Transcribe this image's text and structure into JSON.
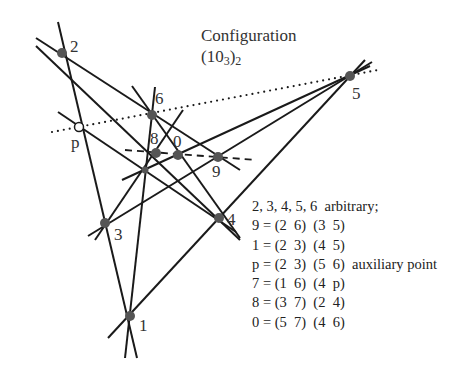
{
  "title": "Configuration",
  "subtitle": {
    "base": "(10",
    "sub1": "3",
    "close": ")",
    "sub2": "2"
  },
  "points": [
    {
      "id": "2",
      "label": "2",
      "x": 62,
      "y": 53,
      "style": "filled",
      "lx": 70,
      "ly": 38
    },
    {
      "id": "5",
      "label": "5",
      "x": 350,
      "y": 76,
      "style": "filled",
      "lx": 352,
      "ly": 85
    },
    {
      "id": "6",
      "label": "6",
      "x": 152,
      "y": 115,
      "style": "filled",
      "lx": 155,
      "ly": 90
    },
    {
      "id": "p",
      "label": "p",
      "x": 79,
      "y": 127,
      "style": "open",
      "lx": 71,
      "ly": 134
    },
    {
      "id": "8",
      "label": "8",
      "x": 156,
      "y": 153,
      "style": "filled",
      "lx": 150,
      "ly": 130
    },
    {
      "id": "0",
      "label": "0",
      "x": 178,
      "y": 155,
      "style": "filled",
      "lx": 173,
      "ly": 133
    },
    {
      "id": "9",
      "label": "9",
      "x": 218,
      "y": 157,
      "style": "filled",
      "lx": 212,
      "ly": 163
    },
    {
      "id": "7",
      "label": "",
      "x": 145,
      "y": 170,
      "style": "small"
    },
    {
      "id": "3",
      "label": "3",
      "x": 105,
      "y": 223,
      "style": "filled",
      "lx": 114,
      "ly": 226
    },
    {
      "id": "4",
      "label": "4",
      "x": 219,
      "y": 218,
      "style": "filled",
      "lx": 227,
      "ly": 211
    },
    {
      "id": "1",
      "label": "1",
      "x": 130,
      "y": 316,
      "style": "filled",
      "lx": 139,
      "ly": 317
    }
  ],
  "lines": [
    {
      "name": "line-2-p-3-1",
      "from": [
        58,
        22
      ],
      "to": [
        137,
        358
      ],
      "style": "solid"
    },
    {
      "name": "line-2-6-9",
      "from": [
        36,
        38
      ],
      "to": [
        240,
        170
      ],
      "style": "solid"
    },
    {
      "name": "line-2-8-4",
      "from": [
        36,
        46
      ],
      "to": [
        240,
        240
      ],
      "style": "solid"
    },
    {
      "name": "line-3-9-5",
      "from": [
        88,
        236
      ],
      "to": [
        372,
        62
      ],
      "style": "solid"
    },
    {
      "name": "line-1-4-5",
      "from": [
        108,
        338
      ],
      "to": [
        365,
        60
      ],
      "style": "solid"
    },
    {
      "name": "line-1-6-7",
      "from": [
        125,
        358
      ],
      "to": [
        155,
        87
      ],
      "style": "solid"
    },
    {
      "name": "line-4-6-0",
      "from": [
        132,
        86
      ],
      "to": [
        240,
        238
      ],
      "style": "solid"
    },
    {
      "name": "line-4-p-7",
      "from": [
        58,
        112
      ],
      "to": [
        236,
        232
      ],
      "style": "solid"
    },
    {
      "name": "line-3-7-8",
      "from": [
        95,
        240
      ],
      "to": [
        183,
        110
      ],
      "style": "solid"
    },
    {
      "name": "line-5-7-0",
      "from": [
        122,
        180
      ],
      "to": [
        370,
        66
      ],
      "style": "solid"
    },
    {
      "name": "line-5-6-p",
      "from": [
        52,
        132
      ],
      "to": [
        378,
        70
      ],
      "style": "dotted"
    },
    {
      "name": "line-8-0-9",
      "from": [
        125,
        150
      ],
      "to": [
        256,
        160
      ],
      "style": "dashed"
    }
  ],
  "legend": [
    "2, 3, 4, 5, 6  arbitrary;",
    "9 = (2  6)  (3  5)",
    "1 = (2  3)  (4  5)",
    "p = (2  3)  (5  6)  auxiliary point",
    "7 = (1  6)  (4  p)",
    "8 = (3  7)  (2  4)",
    "0 = (5  7)  (4  6)"
  ],
  "colors": {
    "line": "#1a1a1a",
    "point": "#555555",
    "text": "#333333"
  }
}
